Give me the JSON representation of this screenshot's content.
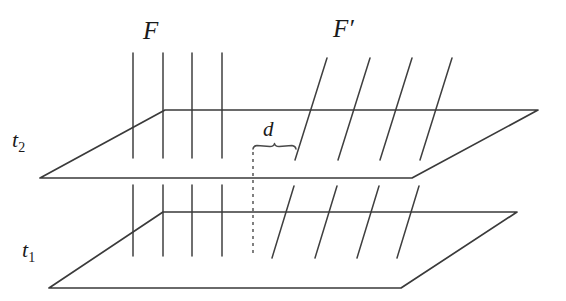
{
  "figure": {
    "background_color": "#ffffff",
    "ink_color": "#3a3a3a",
    "labels": {
      "family_f": "F",
      "family_f_prime": "F′",
      "distance": "d",
      "time_upper_base": "t",
      "time_upper_sub": "2",
      "time_lower_base": "t",
      "time_lower_sub": "1"
    },
    "icon_names": {
      "brace": "underbrace-icon",
      "dashed_drop": "dashed-drop-line-icon"
    }
  },
  "chart_data": {
    "type": "diagram",
    "xlabel": "",
    "ylabel": "",
    "grid": false,
    "legend": "none",
    "planes": [
      {
        "name": "t2",
        "label": "t2",
        "label_x": 12,
        "label_y": 141,
        "corners": [
          [
            40,
            178
          ],
          [
            165,
            110
          ],
          [
            538,
            110
          ],
          [
            412,
            178
          ]
        ],
        "stroke": "#3a3a3a",
        "stroke_width": 1.6
      },
      {
        "name": "t1",
        "label": "t1",
        "label_x": 22,
        "label_y": 251,
        "corners": [
          [
            49,
            288
          ],
          [
            163,
            212
          ],
          [
            517,
            212
          ],
          [
            401,
            288
          ]
        ],
        "stroke": "#3a3a3a",
        "stroke_width": 1.6
      }
    ],
    "family_F": {
      "label": "F",
      "label_x": 152,
      "label_y": 32,
      "description": "four vertical lines perpendicular to the planes",
      "orientation": "vertical",
      "slant_dx": 0,
      "upper_segments": [
        {
          "x1": 133,
          "y1": 53,
          "x2": 133,
          "y2": 158
        },
        {
          "x1": 163,
          "y1": 53,
          "x2": 163,
          "y2": 158
        },
        {
          "x1": 192,
          "y1": 53,
          "x2": 192,
          "y2": 158
        },
        {
          "x1": 222,
          "y1": 53,
          "x2": 222,
          "y2": 158
        }
      ],
      "lower_segments": [
        {
          "x1": 133,
          "y1": 185,
          "x2": 133,
          "y2": 256
        },
        {
          "x1": 163,
          "y1": 185,
          "x2": 163,
          "y2": 256
        },
        {
          "x1": 192,
          "y1": 185,
          "x2": 192,
          "y2": 256
        },
        {
          "x1": 222,
          "y1": 185,
          "x2": 222,
          "y2": 256
        }
      ]
    },
    "family_F_prime": {
      "label": "F′",
      "label_x": 342,
      "label_y": 30,
      "description": "four slanted lines, tilted to the right",
      "orientation": "slanted",
      "slant_dx": 32,
      "upper_segments": [
        {
          "x1": 295,
          "y1": 160,
          "x2": 327,
          "y2": 58
        },
        {
          "x1": 338,
          "y1": 160,
          "x2": 370,
          "y2": 58
        },
        {
          "x1": 380,
          "y1": 160,
          "x2": 412,
          "y2": 58
        },
        {
          "x1": 420,
          "y1": 160,
          "x2": 452,
          "y2": 58
        }
      ],
      "lower_segments": [
        {
          "x1": 272,
          "y1": 258,
          "x2": 294,
          "y2": 186
        },
        {
          "x1": 315,
          "y1": 258,
          "x2": 337,
          "y2": 186
        },
        {
          "x1": 357,
          "y1": 258,
          "x2": 379,
          "y2": 186
        },
        {
          "x1": 397,
          "y1": 258,
          "x2": 419,
          "y2": 186
        }
      ]
    },
    "distance_marker": {
      "label": "d",
      "label_x": 268,
      "label_y": 133,
      "brace_left_x": 253,
      "brace_right_x": 296,
      "brace_y": 149,
      "dashed_line": {
        "x": 253,
        "y1": 152,
        "y2": 256,
        "dash": "3 4"
      },
      "meaning": "spacing between the vertical family F and the slanted family F' on plane t2"
    },
    "axis_ranges": {
      "x": [
        0,
        566
      ],
      "y": [
        0,
        301
      ]
    }
  }
}
